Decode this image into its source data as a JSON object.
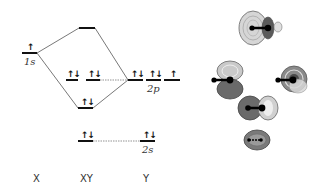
{
  "diagram": {
    "type": "molecular-orbital-energy-diagram",
    "columns": [
      {
        "id": "X",
        "label": "X"
      },
      {
        "id": "XY",
        "label": "XY"
      },
      {
        "id": "Y",
        "label": "Y"
      }
    ],
    "levels": {
      "x_1s": {
        "label": "1s",
        "electrons": "↑"
      },
      "xy_antibonding": {
        "label": "",
        "electrons": ""
      },
      "xy_nonbonding_1": {
        "label": "",
        "electrons": "↑↓"
      },
      "xy_nonbonding_2": {
        "label": "",
        "electrons": "↑↓"
      },
      "xy_bonding": {
        "label": "",
        "electrons": "↑↓"
      },
      "xy_2s": {
        "label": "",
        "electrons": "↑↓"
      },
      "y_2p_1": {
        "label": "",
        "electrons": "↑↓"
      },
      "y_2p_2": {
        "label": "2p",
        "electrons": "↑↓"
      },
      "y_2p_3": {
        "label": "",
        "electrons": "↑"
      },
      "y_2s": {
        "label": "2s",
        "electrons": "↑↓"
      }
    },
    "orbital_plots": [
      {
        "name": "antibonding-sigma-orbital"
      },
      {
        "name": "nonbonding-p-orbital-1"
      },
      {
        "name": "nonbonding-p-orbital-2"
      },
      {
        "name": "bonding-sigma-orbital"
      },
      {
        "name": "2s-orbital"
      }
    ],
    "colors": {
      "line": "#111111",
      "connector": "#555555",
      "orbital_dark": "#5a5a5a",
      "orbital_light": "#c8c8c8"
    }
  }
}
